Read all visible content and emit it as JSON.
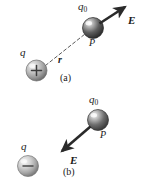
{
  "figure": {
    "background_color": "#ffffff",
    "width": 143,
    "height": 188
  },
  "panels": [
    {
      "id": "a",
      "caption": "(a)",
      "source_charge": {
        "label": "q",
        "sign": "+",
        "sign_glyph": "+",
        "cx": 36.5,
        "cy": 70.5,
        "r": 10.5,
        "fill_light": "#e8e8e8",
        "fill_dark": "#8d8d8d"
      },
      "test_charge": {
        "label": "q",
        "label_subscript": "0",
        "point_label": "P",
        "cx": 93,
        "cy": 28,
        "r": 10.5,
        "fill_light": "#d8d8d8",
        "fill_dark": "#3c3c3c"
      },
      "distance": {
        "label": "r",
        "style": "dashed",
        "from_x": 45,
        "from_y": 65,
        "to_x": 85,
        "to_y": 34
      },
      "field_vector": {
        "label": "E",
        "direction": "up-right",
        "from_x": 99,
        "from_y": 24,
        "to_x": 126,
        "to_y": 7,
        "color": "#2a2a2a"
      }
    },
    {
      "id": "b",
      "caption": "(b)",
      "source_charge": {
        "label": "q",
        "sign": "-",
        "sign_glyph": "−",
        "cx": 28,
        "cy": 166,
        "r": 10.5,
        "fill_light": "#ededed",
        "fill_dark": "#9a9a9a"
      },
      "test_charge": {
        "label": "q",
        "label_subscript": "0",
        "point_label": "P",
        "cx": 98,
        "cy": 120,
        "r": 10.5,
        "fill_light": "#d8d8d8",
        "fill_dark": "#4a4a4a"
      },
      "field_vector": {
        "label": "E",
        "direction": "down-left",
        "from_x": 90,
        "from_y": 127,
        "to_x": 61,
        "to_y": 152,
        "color": "#2a2a2a"
      }
    }
  ],
  "colors": {
    "ink": "#1a1a1a",
    "arrow": "#2a2a2a",
    "dashed_line": "#5a5a5a"
  }
}
